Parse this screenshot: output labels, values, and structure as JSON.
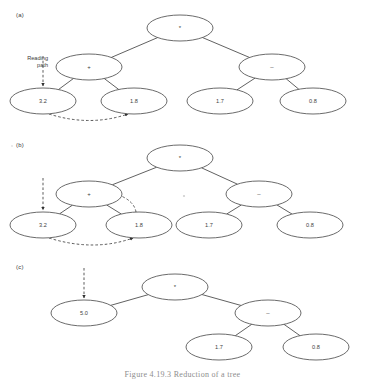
{
  "figure": {
    "caption": "Figure 4.19.3   Reduction of a tree",
    "background_color": "#ffffff",
    "stroke_color": "#454545",
    "text_color": "#3d3d3d"
  },
  "panels": [
    {
      "id": "a",
      "label": "(a)",
      "annotation": {
        "text": "Reading\npath",
        "name": "reading-path-label"
      },
      "nodes": [
        {
          "id": "a-root",
          "label": "*",
          "kind": "operator",
          "cx": 180,
          "cy": 28,
          "rx": 33,
          "ry": 13
        },
        {
          "id": "a-plus",
          "label": "+",
          "kind": "operator",
          "cx": 89,
          "cy": 67,
          "rx": 33,
          "ry": 13
        },
        {
          "id": "a-minus",
          "label": "–",
          "kind": "operator",
          "cx": 272,
          "cy": 67,
          "rx": 33,
          "ry": 13
        },
        {
          "id": "a-3-2",
          "label": "3.2",
          "kind": "value",
          "cx": 43,
          "cy": 101,
          "rx": 33,
          "ry": 13
        },
        {
          "id": "a-1-8",
          "label": "1.8",
          "kind": "value",
          "cx": 134,
          "cy": 101,
          "rx": 33,
          "ry": 13
        },
        {
          "id": "a-1-7",
          "label": "1.7",
          "kind": "value",
          "cx": 220,
          "cy": 101,
          "rx": 33,
          "ry": 13
        },
        {
          "id": "a-0-8",
          "label": "0.8",
          "kind": "value",
          "cx": 313,
          "cy": 101,
          "rx": 33,
          "ry": 13
        }
      ],
      "edges": [
        {
          "from": "a-root",
          "to": "a-plus"
        },
        {
          "from": "a-root",
          "to": "a-minus"
        },
        {
          "from": "a-plus",
          "to": "a-3-2"
        },
        {
          "from": "a-plus",
          "to": "a-1-8"
        },
        {
          "from": "a-minus",
          "to": "a-1-7"
        },
        {
          "from": "a-minus",
          "to": "a-0-8"
        }
      ],
      "dashed_arrows": [
        {
          "name": "reading-path-arrow",
          "kind": "straight",
          "x1": 43,
          "y1": 56,
          "x2": 43,
          "y2": 86
        },
        {
          "name": "leaf-to-leaf-arrow",
          "kind": "curve",
          "x1": 49,
          "y1": 114,
          "cx": 90,
          "cy": 127,
          "x2": 128,
          "y2": 114
        }
      ]
    },
    {
      "id": "b",
      "label": "(b)",
      "annotation": null,
      "nodes": [
        {
          "id": "b-root",
          "label": "*",
          "kind": "operator",
          "cx": 180,
          "cy": 158,
          "rx": 33,
          "ry": 13
        },
        {
          "id": "b-plus",
          "label": "+",
          "kind": "operator",
          "cx": 89,
          "cy": 194,
          "rx": 33,
          "ry": 13
        },
        {
          "id": "b-minus",
          "label": "–",
          "kind": "operator",
          "cx": 259,
          "cy": 194,
          "rx": 33,
          "ry": 13
        },
        {
          "id": "b-3-2",
          "label": "3.2",
          "kind": "value",
          "cx": 43,
          "cy": 225,
          "rx": 33,
          "ry": 13
        },
        {
          "id": "b-1-8",
          "label": "1.8",
          "kind": "value",
          "cx": 139,
          "cy": 225,
          "rx": 33,
          "ry": 13
        },
        {
          "id": "b-1-7",
          "label": "1.7",
          "kind": "value",
          "cx": 209,
          "cy": 225,
          "rx": 33,
          "ry": 13
        },
        {
          "id": "b-0-8",
          "label": "0.8",
          "kind": "value",
          "cx": 310,
          "cy": 225,
          "rx": 33,
          "ry": 13
        }
      ],
      "edges": [
        {
          "from": "b-root",
          "to": "b-plus"
        },
        {
          "from": "b-root",
          "to": "b-minus"
        },
        {
          "from": "b-plus",
          "to": "b-3-2"
        },
        {
          "from": "b-plus",
          "to": "b-1-8"
        },
        {
          "from": "b-minus",
          "to": "b-1-7"
        },
        {
          "from": "b-minus",
          "to": "b-0-8"
        }
      ],
      "dashed_arrows": [
        {
          "name": "reading-path-arrow",
          "kind": "straight",
          "x1": 43,
          "y1": 178,
          "x2": 43,
          "y2": 210
        },
        {
          "name": "leaf-to-leaf-arrow",
          "kind": "curve",
          "x1": 49,
          "y1": 238,
          "cx": 94,
          "cy": 252,
          "x2": 133,
          "y2": 238
        },
        {
          "name": "leaf-to-parent-arrow",
          "kind": "curve",
          "x1": 136,
          "y1": 212,
          "cx": 134,
          "cy": 200,
          "x2": 116,
          "y2": 194
        }
      ]
    },
    {
      "id": "c",
      "label": "(c)",
      "annotation": null,
      "nodes": [
        {
          "id": "c-root",
          "label": "*",
          "kind": "operator",
          "cx": 175,
          "cy": 287,
          "rx": 33,
          "ry": 13
        },
        {
          "id": "c-5-0",
          "label": "5.0",
          "kind": "value",
          "cx": 84,
          "cy": 313,
          "rx": 33,
          "ry": 13
        },
        {
          "id": "c-minus",
          "label": "–",
          "kind": "operator",
          "cx": 268,
          "cy": 313,
          "rx": 33,
          "ry": 13
        },
        {
          "id": "c-1-7",
          "label": "1.7",
          "kind": "value",
          "cx": 219,
          "cy": 347,
          "rx": 33,
          "ry": 13
        },
        {
          "id": "c-0-8",
          "label": "0.8",
          "kind": "value",
          "cx": 316,
          "cy": 347,
          "rx": 33,
          "ry": 13
        }
      ],
      "edges": [
        {
          "from": "c-root",
          "to": "c-5-0"
        },
        {
          "from": "c-root",
          "to": "c-minus"
        },
        {
          "from": "c-minus",
          "to": "c-1-7"
        },
        {
          "from": "c-minus",
          "to": "c-0-8"
        }
      ],
      "dashed_arrows": [
        {
          "name": "reading-path-arrow",
          "kind": "straight",
          "x1": 84,
          "y1": 268,
          "x2": 84,
          "y2": 298
        }
      ]
    }
  ]
}
